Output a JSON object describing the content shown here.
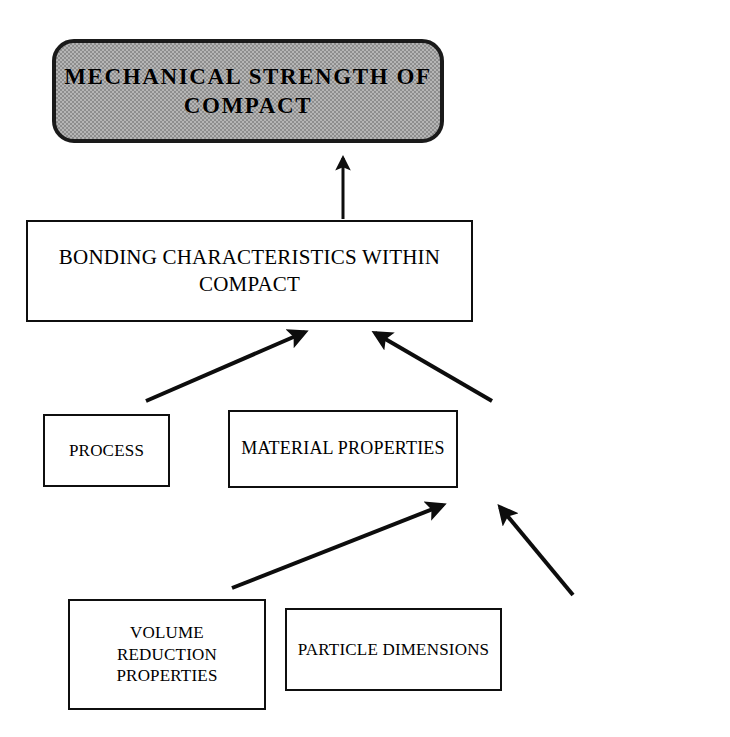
{
  "diagram": {
    "type": "flowchart",
    "orientation": "bottom-up",
    "colors": {
      "stroke": "#0d0d0d",
      "root_fill": "#b5b5b5",
      "node_fill": "#ffffff",
      "text": "#000000"
    },
    "nodes": [
      {
        "id": "root",
        "label": "MECHANICAL STRENGTH OF COMPACT",
        "shape": "rounded-rectangle",
        "fill": "gray-dither",
        "level": 0
      },
      {
        "id": "bonding",
        "label": "BONDING CHARACTERISTICS WITHIN COMPACT",
        "shape": "rectangle",
        "fill": "white",
        "level": 1
      },
      {
        "id": "process",
        "label": "PROCESS",
        "shape": "rectangle",
        "fill": "white",
        "level": 2
      },
      {
        "id": "material",
        "label": "MATERIAL PROPERTIES",
        "shape": "rectangle",
        "fill": "white",
        "level": 2
      },
      {
        "id": "volume",
        "label": "VOLUME REDUCTION\nPROPERTIES",
        "shape": "rectangle",
        "fill": "white",
        "level": 3
      },
      {
        "id": "particle",
        "label": "PARTICLE DIMENSIONS",
        "shape": "rectangle",
        "fill": "white",
        "level": 3
      }
    ],
    "edges": [
      {
        "id": "edge-bonding-to-root",
        "from": "bonding",
        "to": "root",
        "style": "solid-arrow",
        "x1": 343,
        "y1": 219,
        "x2": 343,
        "y2": 154,
        "width": 3
      },
      {
        "id": "edge-process-to-bonding",
        "from": "process",
        "to": "bonding",
        "style": "solid-arrow",
        "x1": 146,
        "y1": 401,
        "x2": 308,
        "y2": 330,
        "width": 4
      },
      {
        "id": "edge-material-to-bonding",
        "from": "material",
        "to": "bonding",
        "style": "solid-arrow",
        "x1": 492,
        "y1": 401,
        "x2": 372,
        "y2": 331,
        "width": 4
      },
      {
        "id": "edge-volume-to-material",
        "from": "volume",
        "to": "material",
        "style": "solid-arrow",
        "x1": 232,
        "y1": 588,
        "x2": 446,
        "y2": 503,
        "width": 4
      },
      {
        "id": "edge-particle-to-material",
        "from": "particle",
        "to": "material",
        "style": "solid-arrow",
        "x1": 573,
        "y1": 595,
        "x2": 497,
        "y2": 504,
        "width": 4
      }
    ]
  }
}
